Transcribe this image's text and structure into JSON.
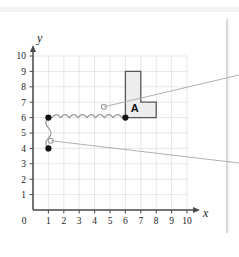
{
  "figure": {
    "kind": "coordinate-grid-diagram",
    "axis_labels": {
      "x": "x",
      "y": "y"
    },
    "x_ticks": [
      "0",
      "1",
      "2",
      "3",
      "4",
      "5",
      "6",
      "7",
      "8",
      "9",
      "10"
    ],
    "y_ticks": [
      "0",
      "1",
      "2",
      "3",
      "4",
      "5",
      "6",
      "7",
      "8",
      "9",
      "10"
    ],
    "x_range": [
      0,
      10
    ],
    "y_range": [
      0,
      10
    ],
    "grid": true,
    "shape_label": "A",
    "colors": {
      "grid": "#dcdcdc",
      "axis": "#4a4a4a",
      "shape_fill": "#ededed",
      "shape_stroke": "#585858",
      "spring": "#9a9a9a",
      "dot": "#111111",
      "leader": "#b0b0b0",
      "card": "#ffffff",
      "page": "#ffffff"
    },
    "shape_A": {
      "name": "L-shaped polygon",
      "vertices": [
        [
          6,
          6
        ],
        [
          6,
          9
        ],
        [
          7,
          9
        ],
        [
          7,
          7
        ],
        [
          8,
          7
        ],
        [
          8,
          6
        ]
      ]
    },
    "filled_points": [
      {
        "label": "",
        "x": 1,
        "y": 6
      },
      {
        "label": "",
        "x": 1,
        "y": 4
      },
      {
        "label": "",
        "x": 6,
        "y": 6
      }
    ],
    "open_points": [
      {
        "label": "",
        "x": 4.6,
        "y": 6.7
      },
      {
        "label": "",
        "x": 1.15,
        "y": 4.5
      }
    ],
    "springs": [
      {
        "name": "horizontal-spring",
        "from": [
          1,
          6
        ],
        "to": [
          6,
          6
        ],
        "coils": 8
      },
      {
        "name": "vertical-spring",
        "from": [
          1,
          6
        ],
        "to": [
          1,
          4
        ],
        "coils": 3
      }
    ],
    "leader_lines": [
      {
        "name": "upper-leader",
        "from": [
          4.6,
          6.7
        ],
        "to_edge": "right"
      },
      {
        "name": "lower-leader",
        "from": [
          1.15,
          4.5
        ],
        "to_edge": "right"
      }
    ]
  }
}
